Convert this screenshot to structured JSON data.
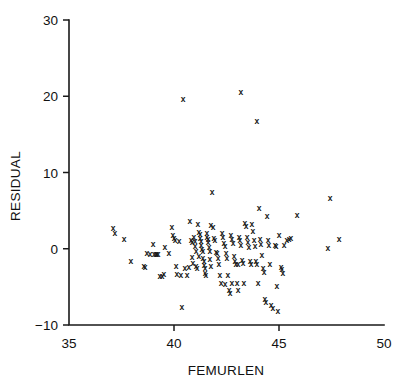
{
  "chart_data": {
    "type": "scatter",
    "title": "",
    "xlabel": "FEMURLEN",
    "ylabel": "RESIDUAL",
    "xlim": [
      35,
      50
    ],
    "ylim": [
      -10,
      30
    ],
    "xticks": [
      35,
      40,
      45,
      50
    ],
    "yticks": [
      -10,
      0,
      10,
      20,
      30
    ],
    "xtick_labels": [
      "35",
      "40",
      "45",
      "50"
    ],
    "ytick_labels": [
      "−10",
      "0",
      "10",
      "20",
      "30"
    ],
    "grid": false,
    "legend": null,
    "marker": "x",
    "marker_color": "#161616",
    "axis_color": "#1a1a1a",
    "background": "#ffffff",
    "n_points": 148,
    "points": [
      [
        37.1,
        2.75
      ],
      [
        37.19,
        2.1
      ],
      [
        37.62,
        1.3
      ],
      [
        37.95,
        -1.6
      ],
      [
        38.57,
        -2.3
      ],
      [
        38.62,
        -2.45
      ],
      [
        38.71,
        -0.6
      ],
      [
        38.86,
        -0.7
      ],
      [
        39.0,
        0.65
      ],
      [
        39.05,
        -0.65
      ],
      [
        39.14,
        -0.7
      ],
      [
        39.24,
        -0.7
      ],
      [
        39.33,
        -3.6
      ],
      [
        39.43,
        -3.55
      ],
      [
        39.52,
        -3.3
      ],
      [
        39.57,
        0.25
      ],
      [
        39.76,
        -0.6
      ],
      [
        39.9,
        2.9
      ],
      [
        39.95,
        1.75
      ],
      [
        40.0,
        1.45
      ],
      [
        40.05,
        1.15
      ],
      [
        40.1,
        -2.3
      ],
      [
        40.14,
        -3.3
      ],
      [
        40.33,
        -3.5
      ],
      [
        40.38,
        -7.7
      ],
      [
        40.43,
        19.6
      ],
      [
        40.52,
        -2.55
      ],
      [
        40.62,
        -3.4
      ],
      [
        40.71,
        -2.4
      ],
      [
        40.76,
        3.6
      ],
      [
        40.81,
        1.2
      ],
      [
        40.86,
        0.95
      ],
      [
        40.86,
        -1.05
      ],
      [
        40.9,
        -1.85
      ],
      [
        40.95,
        1.55
      ],
      [
        41.0,
        1.0
      ],
      [
        41.0,
        0.3
      ],
      [
        41.05,
        -0.3
      ],
      [
        41.05,
        -2.3
      ],
      [
        41.1,
        -2.55
      ],
      [
        41.14,
        3.2
      ],
      [
        41.19,
        2.25
      ],
      [
        41.24,
        1.9
      ],
      [
        41.24,
        1.4
      ],
      [
        41.29,
        1.05
      ],
      [
        41.29,
        0.55
      ],
      [
        41.33,
        0.0
      ],
      [
        41.38,
        -0.35
      ],
      [
        41.38,
        -1.15
      ],
      [
        41.43,
        -1.55
      ],
      [
        41.43,
        -2.1
      ],
      [
        41.48,
        -2.5
      ],
      [
        41.48,
        -3.2
      ],
      [
        41.52,
        -3.45
      ],
      [
        41.57,
        2.05
      ],
      [
        41.57,
        1.6
      ],
      [
        41.62,
        1.3
      ],
      [
        41.62,
        0.85
      ],
      [
        41.67,
        0.25
      ],
      [
        41.71,
        -0.25
      ],
      [
        41.71,
        -1.35
      ],
      [
        41.76,
        -2.2
      ],
      [
        41.76,
        3.05
      ],
      [
        41.81,
        7.45
      ],
      [
        41.86,
        2.85
      ],
      [
        41.9,
        1.45
      ],
      [
        41.95,
        1.1
      ],
      [
        42.0,
        -0.4
      ],
      [
        42.05,
        -0.55
      ],
      [
        42.1,
        -1.2
      ],
      [
        42.14,
        -2.05
      ],
      [
        42.19,
        -3.45
      ],
      [
        42.24,
        -4.55
      ],
      [
        42.29,
        2.1
      ],
      [
        42.33,
        1.5
      ],
      [
        42.38,
        0.8
      ],
      [
        42.43,
        0.35
      ],
      [
        42.48,
        -0.55
      ],
      [
        42.52,
        -1.2
      ],
      [
        42.57,
        -3.4
      ],
      [
        42.62,
        -5.35
      ],
      [
        42.67,
        -5.75
      ],
      [
        42.71,
        1.75
      ],
      [
        42.76,
        1.3
      ],
      [
        42.81,
        0.75
      ],
      [
        42.86,
        -0.95
      ],
      [
        42.9,
        -1.55
      ],
      [
        42.95,
        -1.95
      ],
      [
        43.0,
        -4.5
      ],
      [
        43.05,
        -5.45
      ],
      [
        43.1,
        1.55
      ],
      [
        43.14,
        1.1
      ],
      [
        43.19,
        0.45
      ],
      [
        43.19,
        20.5
      ],
      [
        43.24,
        -1.5
      ],
      [
        43.29,
        -1.9
      ],
      [
        43.33,
        -4.45
      ],
      [
        43.38,
        3.35
      ],
      [
        43.43,
        2.95
      ],
      [
        43.48,
        1.6
      ],
      [
        43.52,
        0.95
      ],
      [
        43.57,
        0.25
      ],
      [
        43.62,
        -1.6
      ],
      [
        43.67,
        -2.05
      ],
      [
        43.71,
        3.3
      ],
      [
        43.76,
        2.35
      ],
      [
        43.81,
        1.1
      ],
      [
        43.86,
        0.4
      ],
      [
        43.9,
        -1.55
      ],
      [
        43.95,
        -1.95
      ],
      [
        43.95,
        16.7
      ],
      [
        44.0,
        -4.45
      ],
      [
        44.05,
        5.4
      ],
      [
        44.1,
        1.3
      ],
      [
        44.14,
        0.65
      ],
      [
        44.19,
        -0.85
      ],
      [
        44.24,
        -2.55
      ],
      [
        44.29,
        -3.05
      ],
      [
        44.33,
        -6.55
      ],
      [
        44.38,
        -6.95
      ],
      [
        44.43,
        4.3
      ],
      [
        44.48,
        1.1
      ],
      [
        44.52,
        0.55
      ],
      [
        44.57,
        -1.95
      ],
      [
        44.62,
        -7.35
      ],
      [
        44.71,
        -7.75
      ],
      [
        44.81,
        0.55
      ],
      [
        44.86,
        0.4
      ],
      [
        44.9,
        -4.85
      ],
      [
        44.95,
        -8.1
      ],
      [
        45.0,
        1.8
      ],
      [
        45.1,
        -2.35
      ],
      [
        45.14,
        -2.65
      ],
      [
        45.19,
        -3.2
      ],
      [
        45.24,
        0.55
      ],
      [
        45.38,
        1.2
      ],
      [
        45.48,
        1.25
      ],
      [
        45.57,
        1.35
      ],
      [
        45.86,
        4.45
      ],
      [
        47.33,
        0.1
      ],
      [
        47.43,
        6.7
      ],
      [
        47.86,
        1.3
      ],
      [
        42.43,
        -4.6
      ],
      [
        42.76,
        -4.45
      ],
      [
        39.19,
        -0.65
      ],
      [
        40.24,
        1.05
      ],
      [
        41.19,
        -0.95
      ],
      [
        43.05,
        -1.95
      ]
    ]
  },
  "axis": {
    "x_title": "FEMURLEN",
    "y_title": "RESIDUAL"
  }
}
